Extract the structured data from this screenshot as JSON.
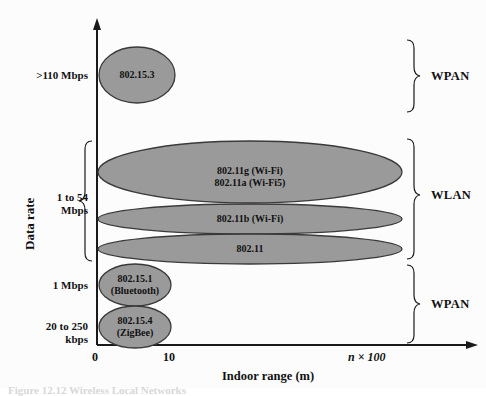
{
  "figure": {
    "axes": {
      "y_title": "Data rate",
      "x_title": "Indoor range (m)",
      "x_ticks": [
        "0",
        "10",
        "n × 100"
      ],
      "y_rate_labels": [
        {
          "id": "r1",
          "text": ">110 Mbps"
        },
        {
          "id": "r2",
          "line1": "1 to 54",
          "line2": "Mbps"
        },
        {
          "id": "r3",
          "text": "1 Mbps"
        },
        {
          "id": "r4",
          "line1": "20 to 250",
          "line2": "kbps"
        }
      ]
    },
    "ellipses": [
      {
        "id": "e1",
        "line1": "802.15.3",
        "line2": ""
      },
      {
        "id": "e2",
        "line1": "802.11g (Wi-Fi)",
        "line2": "802.11a (Wi-Fi5)"
      },
      {
        "id": "e3",
        "line1": "802.11b (Wi-Fi)",
        "line2": ""
      },
      {
        "id": "e4",
        "line1": "802.11",
        "line2": ""
      },
      {
        "id": "e5",
        "line1": "802.15.1",
        "line2": "(Bluetooth)"
      },
      {
        "id": "e6",
        "line1": "802.15.4",
        "line2": "(ZigBee)"
      }
    ],
    "groups": [
      {
        "id": "g1",
        "label": "WPAN"
      },
      {
        "id": "g2",
        "label": "WLAN"
      },
      {
        "id": "g3",
        "label": "WPAN"
      }
    ],
    "colors": {
      "ellipse_fill": "#9a9a9a",
      "ellipse_stroke": "#3a3a3a",
      "axis": "#1a1a1a",
      "text": "#111111"
    },
    "caption": "Figure 12.12  Wireless Local Networks"
  }
}
